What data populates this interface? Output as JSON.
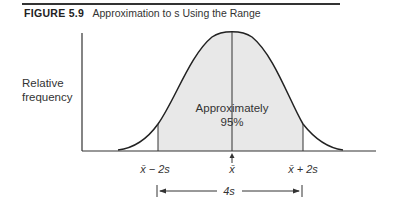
{
  "figure": {
    "number": "FIGURE 5.9",
    "caption": "Approximation to s Using the Range"
  },
  "axes": {
    "ylabel_line1": "Relative",
    "ylabel_line2": "frequency"
  },
  "curve": {
    "area_label_line1": "Approximately",
    "area_label_line2": "95%",
    "fill_color": "#e8e8e8",
    "line_color": "#222222"
  },
  "markers": {
    "left": "x̄ − 2s",
    "center": "x̄",
    "right": "x̄ + 2s",
    "span": "4s"
  }
}
